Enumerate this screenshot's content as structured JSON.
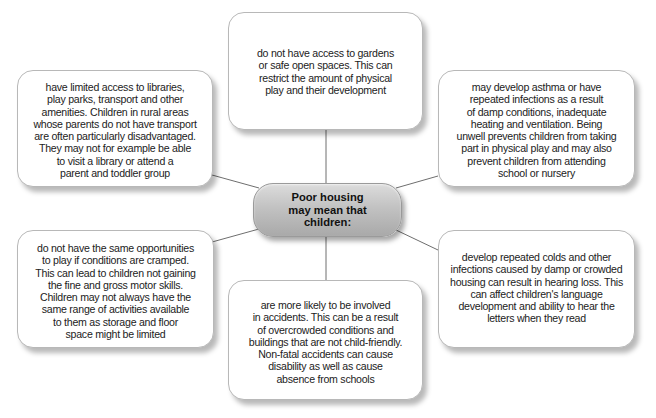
{
  "diagram": {
    "type": "spider-diagram",
    "center": {
      "label": "Poor housing\nmay mean that\nchildren:"
    },
    "branches": [
      {
        "position": "top",
        "text": "do not have access to gardens\nor safe open spaces.  This can\nrestrict the amount of physical\nplay and their development"
      },
      {
        "position": "top-left",
        "text": "have limited access to libraries,\nplay parks, transport and other\namenities.  Children in rural areas\nwhose parents do not have transport\nare often particularly disadvantaged.\nThey may not for example be able\nto visit a library or attend a\nparent and toddler group"
      },
      {
        "position": "top-right",
        "text": "may develop asthma or have\nrepeated infections as a result\nof damp conditions, inadequate\nheating and ventilation.  Being\nunwell prevents children from taking\npart in physical play and may also\nprevent children from attending\nschool or nursery"
      },
      {
        "position": "bottom-left",
        "text": "do not have the same opportunities\nto play if conditions are cramped.\nThis can lead to children not gaining\nthe fine and gross motor skills.\nChildren may not always have the\nsame range of activities available\nto them as storage and floor\nspace might be limited"
      },
      {
        "position": "bottom",
        "text": "are more likely to be involved\nin accidents.  This can be a result\nof overcrowded conditions and\nbuildings that are not child-friendly.\nNon-fatal accidents can cause\ndisability as well as cause\nabsence from schools"
      },
      {
        "position": "bottom-right",
        "text": "develop repeated colds and other\ninfections caused by damp or crowded\nhousing can result in hearing loss.  This\ncan affect children's language\ndevelopment and ability to hear the\nletters when they read"
      }
    ],
    "colors": {
      "connector": "#6e6e6e",
      "box_border": "#b8b8b8",
      "center_fill": "#c2c2c2"
    }
  }
}
